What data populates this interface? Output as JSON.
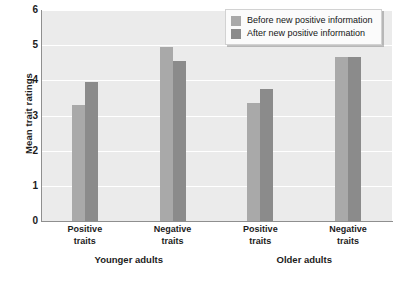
{
  "chart_data": {
    "type": "bar",
    "title": "",
    "xlabel": "",
    "ylabel": "Mean trait ratings",
    "ylim": [
      0,
      6
    ],
    "yticks": [
      0,
      1,
      2,
      3,
      4,
      5,
      6
    ],
    "ytick_labels": [
      "0",
      "1",
      "2",
      "3",
      "4",
      "5",
      "6"
    ],
    "grid": true,
    "legend_position": "top-right",
    "categories": [
      "Positive traits",
      "Negative traits",
      "Positive traits",
      "Negative traits"
    ],
    "category_lines": [
      [
        "Positive",
        "traits"
      ],
      [
        "Negative",
        "traits"
      ],
      [
        "Positive",
        "traits"
      ],
      [
        "Negative",
        "traits"
      ]
    ],
    "groups": [
      {
        "label": "Younger adults",
        "categories": [
          "Positive traits",
          "Negative traits"
        ]
      },
      {
        "label": "Older adults",
        "categories": [
          "Positive traits",
          "Negative traits"
        ]
      }
    ],
    "series": [
      {
        "name": "Before new positive information",
        "color": "#a9a9a9",
        "values": [
          3.3,
          4.95,
          3.35,
          4.65
        ]
      },
      {
        "name": "After new positive information",
        "color": "#8b8b8b",
        "values": [
          3.95,
          4.55,
          3.75,
          4.65
        ]
      }
    ]
  },
  "legend": {
    "items": [
      {
        "label": "Before new positive information",
        "swatch": "before"
      },
      {
        "label": "After new positive information",
        "swatch": "after"
      }
    ]
  },
  "axis": {
    "y_title": "Mean trait ratings"
  },
  "colors": {
    "before_bar": "#a9a9a9",
    "after_bar": "#8b8b8b",
    "plot_background": "#ebebeb",
    "gridline": "#ffffff",
    "axis_line": "#8f8f8f",
    "text": "#1c1c1c"
  }
}
